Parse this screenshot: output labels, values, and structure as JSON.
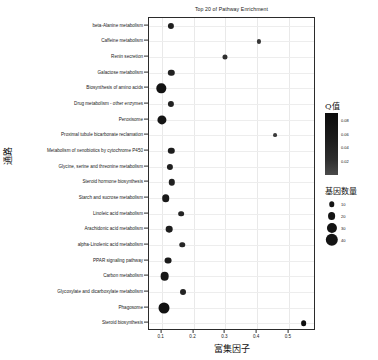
{
  "chart_data": {
    "type": "scatter",
    "title": "Top 20 of Pathway Enrichment",
    "xlabel": "富集因子",
    "ylabel": "通路",
    "xlim": [
      0.06,
      0.585
    ],
    "xticks": [
      0.1,
      0.2,
      0.3,
      0.4,
      0.5
    ],
    "xtick_labels": [
      "0.1",
      "0.2",
      "0.3",
      "0.4",
      "0.5"
    ],
    "grid": true,
    "legend_position": "right",
    "color_legend": {
      "title": "Q值",
      "ticks": [
        0.08,
        0.06,
        0.04,
        0.02
      ],
      "tick_labels": [
        "0.08",
        "0.06",
        "0.04",
        "0.02"
      ],
      "vmin": 0.0,
      "vmax": 0.09,
      "low_color": "#0c0c0c",
      "high_color": "#4a4a4a"
    },
    "size_legend": {
      "title": "基因数量",
      "values": [
        10,
        20,
        30,
        40
      ],
      "labels": [
        "10",
        "20",
        "30",
        "40"
      ]
    },
    "categories": [
      "beta-Alanine metabolism",
      "Caffeine metabolism",
      "Renin secretion",
      "Galactose metabolism",
      "Biosynthesis of amino acids",
      "Drug metabolism - other enzymes",
      "Peroxisome",
      "Proximal tubule bicarbonate reclamation",
      "Metabolism of xenobiotics by cytochrome P450",
      "Glycine, serine and threonine metabolism",
      "Steroid hormone biosynthesis",
      "Starch and sucrose metabolism",
      "Linoleic acid metabolism",
      "Arachidonic acid metabolism",
      "alpha-Linolenic acid metabolism",
      "PPAR signaling pathway",
      "Carbon metabolism",
      "Glycoxylate and dicarboxylate metabolism",
      "Phagosome",
      "Steroid biosynthesis"
    ],
    "points": [
      {
        "pathway": "beta-Alanine metabolism",
        "x": 0.128,
        "gene_count": 13,
        "q_value": 0.02
      },
      {
        "pathway": "Caffeine metabolism",
        "x": 0.406,
        "gene_count": 4,
        "q_value": 0.046
      },
      {
        "pathway": "Renin secretion",
        "x": 0.299,
        "gene_count": 8,
        "q_value": 0.038
      },
      {
        "pathway": "Galactose metabolism",
        "x": 0.13,
        "gene_count": 14,
        "q_value": 0.022
      },
      {
        "pathway": "Biosynthesis of amino acids",
        "x": 0.099,
        "gene_count": 27,
        "q_value": 0.008
      },
      {
        "pathway": "Drug metabolism - other enzymes",
        "x": 0.129,
        "gene_count": 13,
        "q_value": 0.024
      },
      {
        "pathway": "Peroxisome",
        "x": 0.101,
        "gene_count": 26,
        "q_value": 0.01
      },
      {
        "pathway": "Proximal tubule bicarbonate reclamation",
        "x": 0.455,
        "gene_count": 3,
        "q_value": 0.05
      },
      {
        "pathway": "Metabolism of xenobiotics by cytochrome P450",
        "x": 0.13,
        "gene_count": 14,
        "q_value": 0.018
      },
      {
        "pathway": "Glycine, serine and threonine metabolism",
        "x": 0.125,
        "gene_count": 13,
        "q_value": 0.021
      },
      {
        "pathway": "Steroid hormone biosynthesis",
        "x": 0.131,
        "gene_count": 14,
        "q_value": 0.023
      },
      {
        "pathway": "Starch and sucrose metabolism",
        "x": 0.113,
        "gene_count": 19,
        "q_value": 0.014
      },
      {
        "pathway": "Linoleic acid metabolism",
        "x": 0.16,
        "gene_count": 11,
        "q_value": 0.026
      },
      {
        "pathway": "Arachidonic acid metabolism",
        "x": 0.124,
        "gene_count": 15,
        "q_value": 0.019
      },
      {
        "pathway": "alpha-Linolenic acid metabolism",
        "x": 0.165,
        "gene_count": 10,
        "q_value": 0.028
      },
      {
        "pathway": "PPAR signaling pathway",
        "x": 0.121,
        "gene_count": 16,
        "q_value": 0.016
      },
      {
        "pathway": "Carbon metabolism",
        "x": 0.109,
        "gene_count": 24,
        "q_value": 0.012
      },
      {
        "pathway": "Glycoxylate and dicarboxylate metabolism",
        "x": 0.168,
        "gene_count": 12,
        "q_value": 0.025
      },
      {
        "pathway": "Phagosome",
        "x": 0.108,
        "gene_count": 34,
        "q_value": 0.006
      },
      {
        "pathway": "Steroid biosynthesis",
        "x": 0.546,
        "gene_count": 11,
        "q_value": 0.002
      }
    ]
  }
}
